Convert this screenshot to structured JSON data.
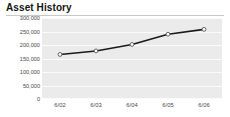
{
  "widget": {
    "title": "Asset History"
  },
  "chart_data": {
    "type": "line",
    "title": "Asset History",
    "xlabel": "",
    "ylabel": "",
    "categories": [
      "6/02",
      "6/03",
      "6/04",
      "6/05",
      "6/06"
    ],
    "x": [
      "6/02",
      "6/03",
      "6/04",
      "6/05",
      "6/06"
    ],
    "values": [
      165000,
      178000,
      202000,
      240000,
      258000
    ],
    "series": [
      {
        "name": "Assets",
        "values": [
          165000,
          178000,
          202000,
          240000,
          258000
        ]
      }
    ],
    "ylim": [
      0,
      300000
    ],
    "yticks": [
      0,
      50000,
      100000,
      150000,
      200000,
      250000,
      300000
    ],
    "ytick_labels": [
      "0",
      "50,000",
      "100,000",
      "150,000",
      "200,000",
      "250,000",
      "300,000"
    ],
    "xtick_labels": [
      "6/02",
      "6/03",
      "6/04",
      "6/05",
      "6/06"
    ],
    "grid": true,
    "grid_orientation": "horizontal",
    "legend": false,
    "legend_position": "none",
    "marker": "circle",
    "colors": {
      "line": "#1a1a1a",
      "marker_fill": "#ffffff",
      "marker_stroke": "#555555",
      "plot_background": "#ebebeb",
      "gridline": "#fbfbfb",
      "title_text": "#141414",
      "tick_text": "#4a4a4a",
      "rule": "#c8c8c8"
    }
  }
}
